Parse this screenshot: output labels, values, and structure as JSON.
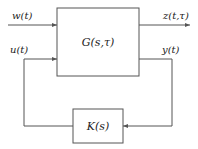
{
  "diagram": {
    "type": "feedback-block-diagram",
    "blocks": {
      "plant": {
        "label": "G(s,τ)"
      },
      "controller": {
        "label": "K(s)"
      }
    },
    "signals": {
      "disturbance_input": "w(t)",
      "control_input": "u(t)",
      "performance_output": "z(t,τ)",
      "measured_output": "y(t)"
    },
    "colors": {
      "line": "#555555",
      "text": "#222222"
    }
  }
}
